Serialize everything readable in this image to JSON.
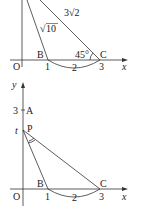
{
  "figure_top": {
    "labels": {
      "side_ac": "3√2",
      "side_ab_root": "√",
      "side_ab_num": "10",
      "point_b": "B",
      "point_c": "C",
      "origin": "O",
      "angle_c": "45°",
      "tick_1": "1",
      "tick_2": "2",
      "tick_3": "3",
      "x_axis": "x"
    }
  },
  "figure_bottom": {
    "labels": {
      "y_axis": "y",
      "tick_y3": "3",
      "point_a": "A",
      "tick_t": "t",
      "point_p": "P",
      "point_b": "B",
      "point_c": "C",
      "origin": "O",
      "tick_1": "1",
      "tick_2": "2",
      "tick_3": "3",
      "x_axis": "x"
    }
  },
  "colors": {
    "line": "#333333",
    "text": "#222222"
  }
}
